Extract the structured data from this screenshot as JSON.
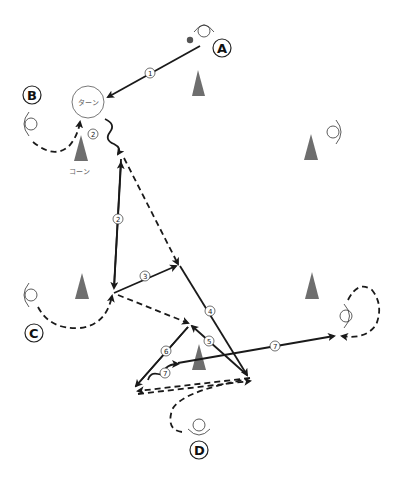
{
  "diagram": {
    "type": "soccer-drill",
    "colors": {
      "line": "#1a1a1a",
      "cone": "#6e6e6e",
      "label_text": "#111111",
      "secondary_text": "#777777",
      "background": "#ffffff"
    },
    "players": [
      {
        "id": "A",
        "label": "A",
        "x": 218,
        "y": 49
      },
      {
        "id": "B",
        "label": "B",
        "x": 33,
        "y": 95
      },
      {
        "id": "C",
        "label": "C",
        "x": 33,
        "y": 333
      },
      {
        "id": "D",
        "label": "D",
        "x": 199,
        "y": 450
      }
    ],
    "turn_marker": {
      "label": "ターン"
    },
    "cone_caption": "コーン",
    "ball": {
      "icon": "soccer-ball-icon"
    },
    "step_labels": {
      "s1": "1",
      "s2a": "2",
      "s2b": "2",
      "s3": "3",
      "s4": "4",
      "s5": "5",
      "s6": "6",
      "s7a": "7",
      "s7b": "7"
    },
    "legend": {
      "solid_line": "pass",
      "dashed_line": "run",
      "wavy_line": "dribble"
    }
  }
}
